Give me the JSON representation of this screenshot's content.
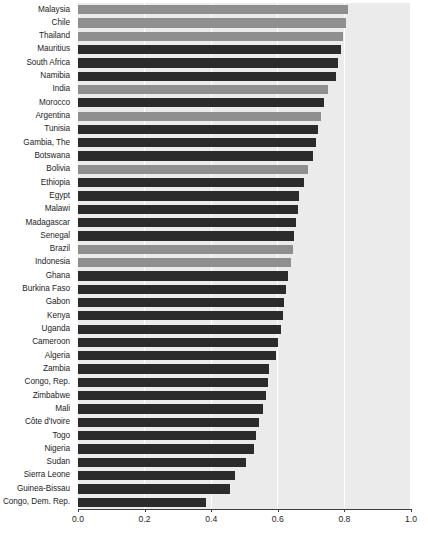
{
  "chart_data": {
    "type": "bar",
    "orientation": "horizontal",
    "title": "",
    "xlabel": "",
    "ylabel": "",
    "xlim": [
      0.0,
      1.0
    ],
    "xticks": [
      "0.0",
      "0.2",
      "0.4",
      "0.6",
      "0.8",
      "1.0"
    ],
    "xtick_values": [
      0.0,
      0.2,
      0.4,
      0.6,
      0.8,
      1.0
    ],
    "grid": "vertical-white-gridlines",
    "legend": "none",
    "colors": {
      "light": "#8f8f8f",
      "dark": "#2b2b2b",
      "panel_background": "#ebebeb",
      "gridline": "#ffffff",
      "axis": "#3c3c3c",
      "text": "#1d1d1d"
    },
    "categories": [
      "Malaysia",
      "Chile",
      "Thailand",
      "Mauritius",
      "South Africa",
      "Namibia",
      "India",
      "Morocco",
      "Argentina",
      "Tunisia",
      "Gambia, The",
      "Botswana",
      "Bolivia",
      "Ethiopia",
      "Egypt",
      "Malawi",
      "Madagascar",
      "Senegal",
      "Brazil",
      "Indonesia",
      "Ghana",
      "Burkina Faso",
      "Gabon",
      "Kenya",
      "Uganda",
      "Cameroon",
      "Algeria",
      "Zambia",
      "Congo, Rep.",
      "Zimbabwe",
      "Mali",
      "Côte d'Ivoire",
      "Togo",
      "Nigeria",
      "Sudan",
      "Sierra Leone",
      "Guinea-Bissau",
      "Congo, Dem. Rep."
    ],
    "values": [
      0.81,
      0.805,
      0.795,
      0.79,
      0.78,
      0.775,
      0.75,
      0.74,
      0.73,
      0.72,
      0.715,
      0.705,
      0.69,
      0.68,
      0.665,
      0.66,
      0.655,
      0.65,
      0.645,
      0.64,
      0.63,
      0.625,
      0.62,
      0.615,
      0.61,
      0.6,
      0.595,
      0.575,
      0.57,
      0.565,
      0.555,
      0.545,
      0.535,
      0.53,
      0.505,
      0.47,
      0.455,
      0.385
    ],
    "series_groups": [
      "light",
      "light",
      "light",
      "dark",
      "dark",
      "dark",
      "light",
      "dark",
      "light",
      "dark",
      "dark",
      "dark",
      "light",
      "dark",
      "dark",
      "dark",
      "dark",
      "dark",
      "light",
      "light",
      "dark",
      "dark",
      "dark",
      "dark",
      "dark",
      "dark",
      "dark",
      "dark",
      "dark",
      "dark",
      "dark",
      "dark",
      "dark",
      "dark",
      "dark",
      "dark",
      "dark",
      "dark"
    ]
  },
  "caption": {
    "text": ""
  }
}
